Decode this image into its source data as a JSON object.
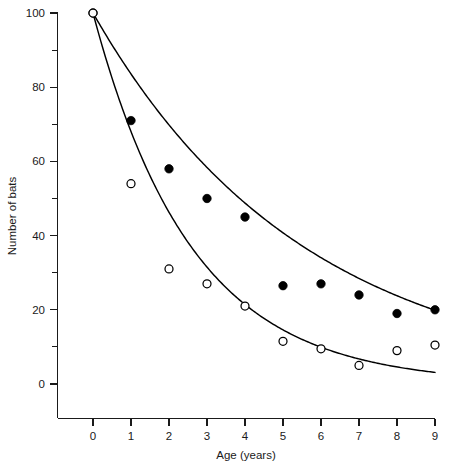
{
  "chart_data": {
    "type": "scatter",
    "title": "",
    "xlabel": "Age (years)",
    "ylabel": "Number of bats",
    "xlim": [
      -0.55,
      9.35
    ],
    "ylim": [
      -3,
      103
    ],
    "grid": false,
    "legend_position": "none",
    "x_ticks": [
      "0",
      "1",
      "2",
      "3",
      "4",
      "5",
      "6",
      "7",
      "8",
      "9"
    ],
    "x_tick_values": [
      0,
      1,
      2,
      3,
      4,
      5,
      6,
      7,
      8,
      9
    ],
    "y_ticks": [
      "0",
      "20",
      "40",
      "60",
      "80",
      "100"
    ],
    "y_tick_values": [
      0,
      20,
      40,
      60,
      80,
      100
    ],
    "y_minor_tick_values": [
      10,
      30,
      50,
      70,
      90
    ],
    "x": [
      0,
      1,
      2,
      3,
      4,
      5,
      6,
      7,
      8,
      9
    ],
    "series": [
      {
        "name": "filled-circles",
        "marker": "filled-circle",
        "color": "#000000",
        "values": [
          100,
          71,
          58,
          50,
          45,
          26.5,
          27,
          24,
          19,
          20
        ]
      },
      {
        "name": "open-circles",
        "marker": "open-circle",
        "color": "#000000",
        "values": [
          100,
          54,
          31,
          27,
          21,
          11.5,
          9.5,
          5,
          9,
          10.5
        ]
      }
    ],
    "fitted_curves": [
      {
        "name": "upper-survival-curve",
        "for_series": "filled-circles",
        "model": "exponential-decay",
        "params": {
          "a": 100,
          "k": 0.1795,
          "c": 0.0
        }
      },
      {
        "name": "lower-survival-curve",
        "for_series": "open-circles",
        "model": "exponential-decay",
        "params": {
          "a": 100,
          "k": 0.385,
          "c": 0.0
        }
      }
    ]
  }
}
